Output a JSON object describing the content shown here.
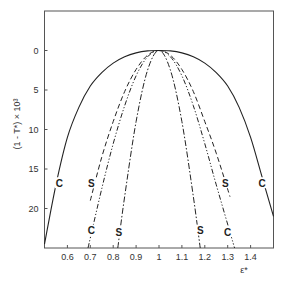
{
  "chart_data": {
    "type": "line",
    "title": "",
    "xlabel": "ε*",
    "ylabel": "(1 - T*) × 10³",
    "xlim": [
      0.5,
      1.5
    ],
    "ylim": [
      -5,
      25
    ],
    "y_inverted": true,
    "grid": false,
    "legend": "none (curves labeled inline with C and S)",
    "x_ticks": [
      0.6,
      0.7,
      0.8,
      0.9,
      1,
      1.1,
      1.2,
      1.3,
      1.4
    ],
    "x_tick_labels": [
      "0.6",
      "0.7",
      "0.8",
      "0.9",
      "1",
      "1.1",
      "1.2",
      "1.3",
      "1.4"
    ],
    "y_ticks": [
      0,
      5,
      10,
      15,
      20
    ],
    "y_tick_labels": [
      "0",
      "5",
      "10",
      "15",
      "20"
    ],
    "series": [
      {
        "name": "C (solid)",
        "label": "C",
        "style": "solid",
        "x": [
          0.5,
          0.55,
          0.6,
          0.65,
          0.7,
          0.75,
          0.8,
          0.85,
          0.9,
          0.95,
          1.0,
          1.05,
          1.1,
          1.15,
          1.2,
          1.25,
          1.3,
          1.35,
          1.4,
          1.45,
          1.5
        ],
        "y": [
          24.5,
          17.0,
          11.0,
          7.2,
          4.5,
          2.8,
          1.6,
          0.8,
          0.3,
          0.05,
          0,
          0.05,
          0.3,
          0.8,
          1.6,
          2.8,
          4.5,
          7.2,
          11.0,
          16.0,
          21.0
        ]
      },
      {
        "name": "S (dashed)",
        "label": "S",
        "style": "dashed",
        "x": [
          0.7,
          0.75,
          0.8,
          0.85,
          0.9,
          0.95,
          1.0,
          1.05,
          1.1,
          1.15,
          1.2,
          1.25,
          1.31
        ],
        "y": [
          19.0,
          13.5,
          9.0,
          5.2,
          2.4,
          0.6,
          0,
          0.6,
          2.4,
          5.2,
          9.0,
          13.0,
          18.5
        ]
      },
      {
        "name": "C (dash-dot-dot)",
        "label": "C",
        "style": "dash-dot-dot",
        "x": [
          0.69,
          0.75,
          0.8,
          0.85,
          0.9,
          0.95,
          1.0,
          1.05,
          1.1,
          1.15,
          1.2,
          1.25,
          1.33
        ],
        "y": [
          25.0,
          17.5,
          11.8,
          7.0,
          3.2,
          0.8,
          0,
          0.8,
          3.2,
          7.0,
          11.8,
          17.0,
          25.0
        ]
      },
      {
        "name": "S (dash-dot)",
        "label": "S",
        "style": "dash-dot",
        "x": [
          0.82,
          0.85,
          0.9,
          0.95,
          1.0,
          1.05,
          1.1,
          1.15,
          1.18
        ],
        "y": [
          25.0,
          18.5,
          9.0,
          2.5,
          0,
          2.5,
          9.0,
          18.5,
          25.0
        ]
      }
    ],
    "annotations": [
      {
        "text": "C",
        "x": 0.565,
        "y": 16.8
      },
      {
        "text": "S",
        "x": 0.705,
        "y": 16.8
      },
      {
        "text": "C",
        "x": 0.705,
        "y": 22.8
      },
      {
        "text": "S",
        "x": 0.825,
        "y": 23.0
      },
      {
        "text": "S",
        "x": 1.18,
        "y": 22.8
      },
      {
        "text": "C",
        "x": 1.3,
        "y": 23.0
      },
      {
        "text": "S",
        "x": 1.29,
        "y": 16.8
      },
      {
        "text": "C",
        "x": 1.45,
        "y": 16.8
      }
    ]
  },
  "colors": {
    "axis": "#555555",
    "curve": "#222222",
    "background": "#ffffff"
  }
}
